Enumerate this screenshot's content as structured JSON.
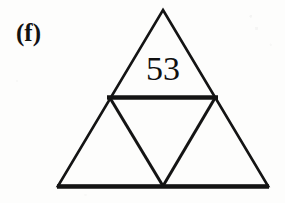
{
  "figure": {
    "panel_label": "(f)",
    "caption_text": "",
    "cell_value": "53",
    "stroke_color": "#141414",
    "background_color": "#fdfdfc",
    "outer_triangle": {
      "apex": [
        163,
        10
      ],
      "bottom_left": [
        58,
        186
      ],
      "bottom_right": [
        268,
        186
      ]
    },
    "midpoints": {
      "left_edge_mid": [
        110,
        98
      ],
      "right_edge_mid": [
        215,
        98
      ],
      "base_mid": [
        163,
        186
      ]
    },
    "sub_triangles": [
      {
        "name": "top",
        "label": "53",
        "filled": false
      },
      {
        "name": "bottom-left",
        "label": "",
        "filled": false
      },
      {
        "name": "bottom-right",
        "label": "",
        "filled": false
      },
      {
        "name": "center-inverted",
        "label": "",
        "filled": false
      }
    ],
    "strokes": {
      "outline_width": 2.6,
      "midline_width": 4.4,
      "base_width": 4.4,
      "inner_width": 3.0
    }
  }
}
